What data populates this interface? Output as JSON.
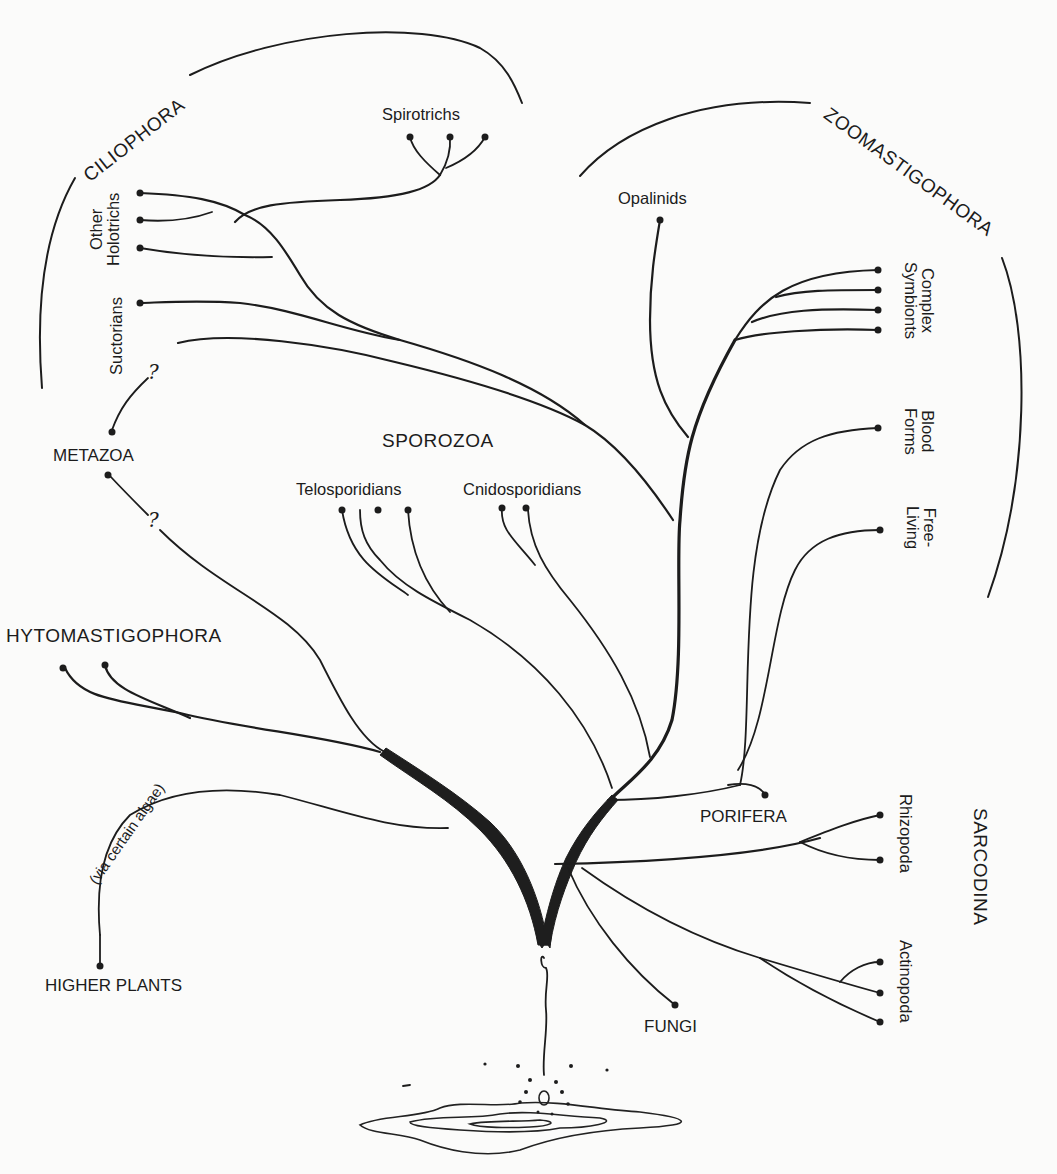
{
  "diagram": {
    "type": "phylogenetic-tree",
    "root": "primordial origin (drop in water)",
    "groups": {
      "ciliophora": "CILIOPHORA",
      "zoomastigophora": "ZOOMASTIGOPHORA",
      "sporozoa": "SPOROZOA",
      "phytomastigophora": "HYTOMASTIGOPHORA",
      "sarcodina": "SARCODINA",
      "metazoa": "METAZOA",
      "higher_plants": "HIGHER PLANTS",
      "porifera": "PORIFERA",
      "fungi": "FUNGI"
    },
    "subgroups": {
      "spirotrichs": "Spirotrichs",
      "other_holotrichs_line1": "Other",
      "other_holotrichs_line2": "Holotrichs",
      "suctorians": "Suctorians",
      "opalinids": "Opalinids",
      "complex_symbionts_line1": "Complex",
      "complex_symbionts_line2": "Symbionts",
      "blood_forms_line1": "Blood",
      "blood_forms_line2": "Forms",
      "free_living_line1": "Free-",
      "free_living_line2": "Living",
      "telosporidians": "Telosporidians",
      "cnidosporidians": "Cnidosporidians",
      "rhizopoda": "Rhizopoda",
      "actinopoda": "Actinopoda"
    },
    "annotations": {
      "via_algae": "(via certain algae)",
      "uncertain_marker": "?"
    },
    "tips": [
      {
        "group": "Ciliophora",
        "name": "Spirotrichs",
        "count": 3
      },
      {
        "group": "Ciliophora",
        "name": "Other Holotrichs",
        "count": 3
      },
      {
        "group": "Ciliophora",
        "name": "Suctorians",
        "count": 1
      },
      {
        "group": "Zoomastigophora",
        "name": "Opalinids",
        "count": 1
      },
      {
        "group": "Zoomastigophora",
        "name": "Complex Symbionts",
        "count": 4
      },
      {
        "group": "Zoomastigophora",
        "name": "Blood Forms",
        "count": 1
      },
      {
        "group": "Zoomastigophora",
        "name": "Free-Living",
        "count": 1
      },
      {
        "group": "Sporozoa",
        "name": "Telosporidians",
        "count": 3
      },
      {
        "group": "Sporozoa",
        "name": "Cnidosporidians",
        "count": 2
      },
      {
        "group": "Phytomastigophora",
        "name": "Phytomastigophora",
        "count": 2
      },
      {
        "group": "Sarcodina",
        "name": "Rhizopoda",
        "count": 2
      },
      {
        "group": "Sarcodina",
        "name": "Actinopoda",
        "count": 3
      },
      {
        "group": "Other",
        "name": "Metazoa",
        "count": 2,
        "uncertain": true
      },
      {
        "group": "Other",
        "name": "Higher Plants",
        "count": 1
      },
      {
        "group": "Other",
        "name": "Porifera",
        "count": 1
      },
      {
        "group": "Other",
        "name": "Fungi",
        "count": 1
      }
    ],
    "colors": {
      "ink": "#1c1c1c",
      "paper": "#fbfbfa"
    }
  }
}
